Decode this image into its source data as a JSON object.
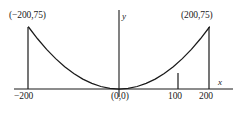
{
  "figure": {
    "title": "",
    "background_color": "#ffffff",
    "stroke_color": "#1a1a1a"
  },
  "labels": {
    "left_point": "(−200,75)",
    "right_point": "(200,75)",
    "origin": "(0,0)",
    "tick_neg200": "−200",
    "tick_100": "100",
    "tick_200": "200",
    "axis_x": "x",
    "axis_y": "y"
  },
  "chart_data": {
    "type": "line",
    "title": "",
    "xlabel": "x",
    "ylabel": "y",
    "grid": false,
    "legend": "none",
    "xlim": [
      -260,
      240
    ],
    "ylim": [
      0,
      95
    ],
    "xticks": [
      -200,
      100,
      200
    ],
    "xticklabels": [
      "−200",
      "100",
      "200"
    ],
    "yticks": [],
    "yticklabels": [],
    "series": [
      {
        "name": "parabola",
        "equation": "y = 75 * (x/200)^2",
        "x": [
          -200,
          -180,
          -160,
          -140,
          -120,
          -100,
          -80,
          -60,
          -40,
          -20,
          0,
          20,
          40,
          60,
          80,
          100,
          120,
          140,
          160,
          180,
          200
        ],
        "values": [
          75,
          60.75,
          48,
          36.75,
          27,
          18.75,
          12,
          6.75,
          3,
          0.75,
          0,
          0.75,
          3,
          6.75,
          12,
          18.75,
          27,
          36.75,
          48,
          60.75,
          75
        ]
      }
    ],
    "annotations": [
      {
        "text": "(−200,75)",
        "x": -200,
        "y": 75
      },
      {
        "text": "(200,75)",
        "x": 200,
        "y": 75
      },
      {
        "text": "(0,0)",
        "x": 0,
        "y": 0
      }
    ],
    "vertical_segments": [
      {
        "x": -200,
        "y_from": 0,
        "y_to": 75
      },
      {
        "x": 100,
        "y_from": 0,
        "y_to": 18.75
      },
      {
        "x": 200,
        "y_from": 0,
        "y_to": 75
      }
    ]
  }
}
